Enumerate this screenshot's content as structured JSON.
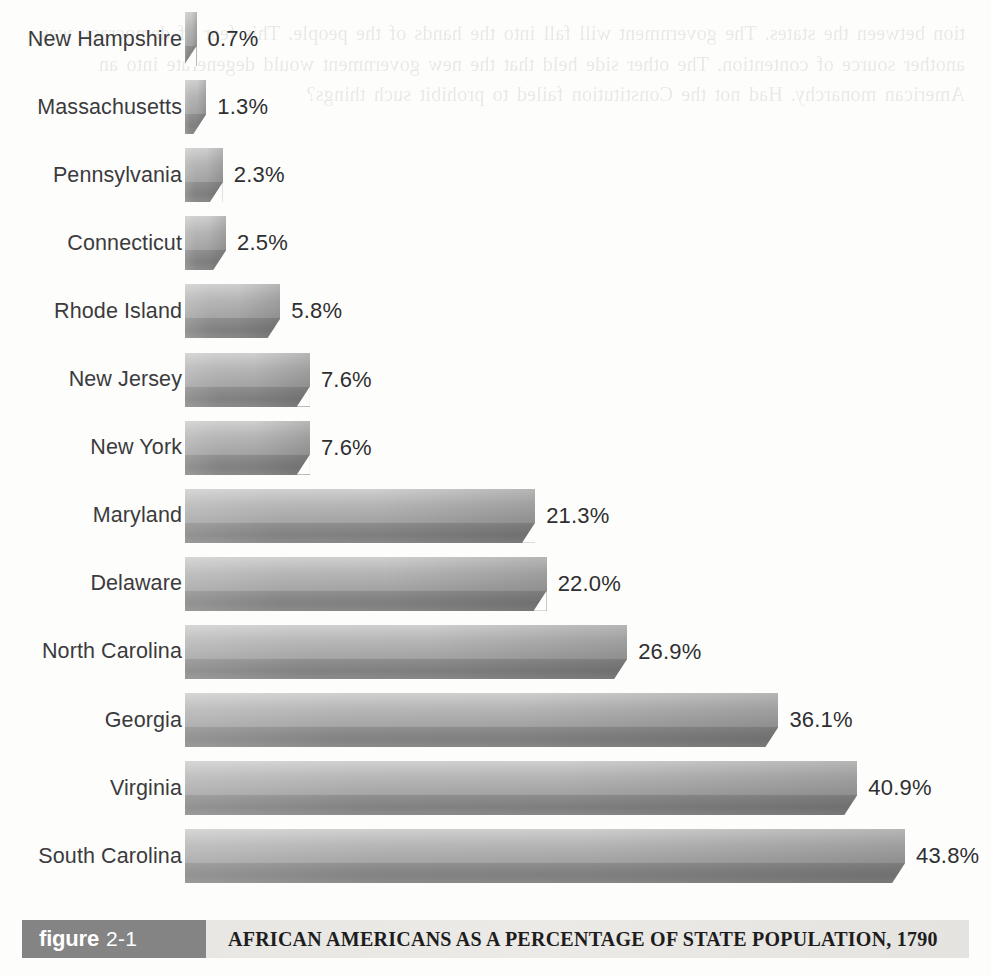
{
  "chart_data": {
    "type": "bar",
    "orientation": "horizontal",
    "title": "AFRICAN AMERICANS AS A PERCENTAGE OF STATE POPULATION, 1790",
    "xlabel": "",
    "ylabel": "",
    "grid": false,
    "legend": "none",
    "xlim": [
      0,
      43.8
    ],
    "value_suffix": "%",
    "categories": [
      "New Hampshire",
      "Massachusetts",
      "Pennsylvania",
      "Connecticut",
      "Rhode Island",
      "New Jersey",
      "New York",
      "Maryland",
      "Delaware",
      "North Carolina",
      "Georgia",
      "Virginia",
      "South Carolina"
    ],
    "values": [
      0.7,
      1.3,
      2.3,
      2.5,
      5.8,
      7.6,
      7.6,
      21.3,
      22.0,
      26.9,
      36.1,
      40.9,
      43.8
    ],
    "value_labels": [
      "0.7%",
      "1.3%",
      "2.3%",
      "2.5%",
      "5.8%",
      "7.6%",
      "7.6%",
      "21.3%",
      "22.0%",
      "26.9%",
      "36.1%",
      "40.9%",
      "43.8%"
    ]
  },
  "caption": {
    "badge_word": "figure",
    "badge_number": "2-1",
    "title": "AFRICAN AMERICANS AS A PERCENTAGE OF STATE POPULATION, 1790"
  },
  "bleed_text": "tion between the states. The government will fall into the hands of the people. This fear of democracy was another source of contention. The other side held that the new government would degenerate into an American monarchy. Had not the Constitution failed to prohibit such things?",
  "colors": {
    "bar_light": "#cfcfcf",
    "bar_mid": "#b5b5b5",
    "bar_dark": "#7e7e7e",
    "label_text": "#3b3b3d",
    "value_text": "#2f2f31",
    "caption_band": "#e9e7e4",
    "caption_badge": "#848484",
    "page_background": "#fdfdfc"
  }
}
